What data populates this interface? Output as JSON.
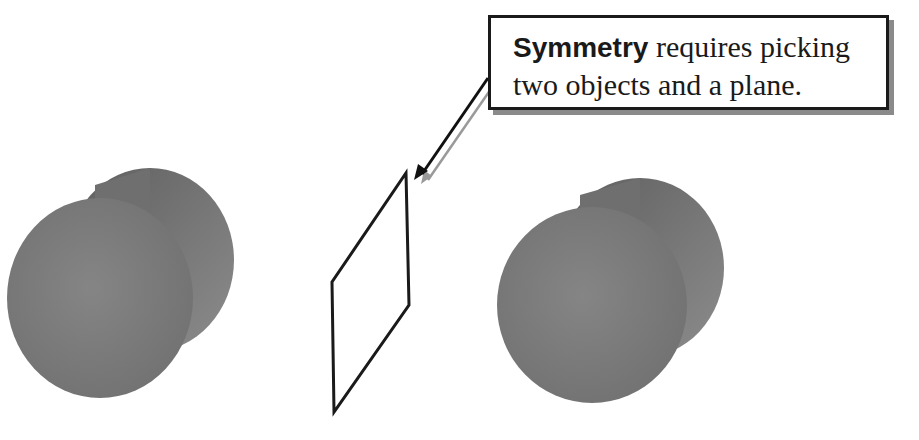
{
  "callout": {
    "bold_term": "Symmetry",
    "line1_rest": " requires picking",
    "line2": "two objects and a plane."
  },
  "scene": {
    "objects": [
      {
        "name": "left-cylinder",
        "type": "cylinder",
        "color": "#7a7a7a"
      },
      {
        "name": "symmetry-plane",
        "type": "plane",
        "color": "#1a1a1a"
      },
      {
        "name": "right-cylinder",
        "type": "cylinder",
        "color": "#777777"
      }
    ],
    "colors": {
      "cylinder_face": "#7c7c7c",
      "cylinder_side": "#6a6a6a",
      "outline": "#1a1a1a",
      "shadow": "#8a8a8a"
    }
  }
}
